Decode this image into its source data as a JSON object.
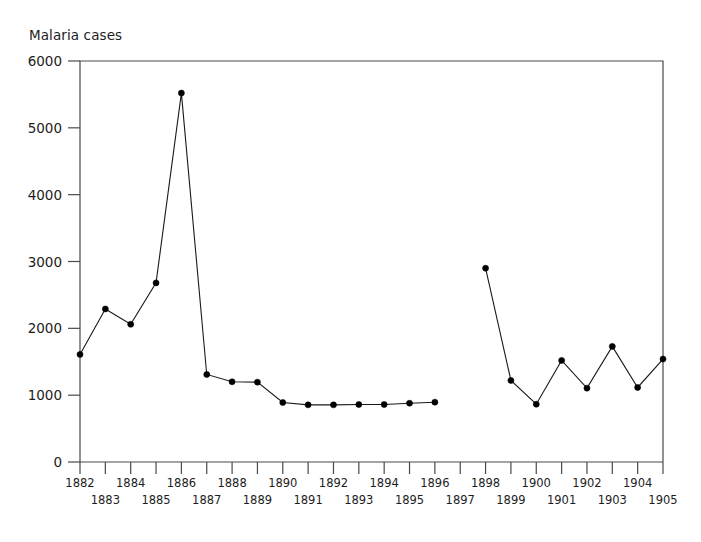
{
  "chart_data": {
    "type": "line",
    "title": "",
    "ylabel": "Malaria cases",
    "xlabel": "",
    "ylim": [
      0,
      6000
    ],
    "yticks": [
      0,
      1000,
      2000,
      3000,
      4000,
      5000,
      6000
    ],
    "ytick_labels": [
      "0",
      "1000",
      "2000",
      "3000",
      "4000",
      "5000",
      "6000"
    ],
    "xlim": [
      1882,
      1905
    ],
    "xticks": [
      1882,
      1883,
      1884,
      1885,
      1886,
      1887,
      1888,
      1889,
      1890,
      1891,
      1892,
      1893,
      1894,
      1895,
      1896,
      1897,
      1898,
      1899,
      1900,
      1901,
      1902,
      1903,
      1904,
      1905
    ],
    "xtick_labels": [
      "1882",
      "1883",
      "1884",
      "1885",
      "1886",
      "1887",
      "1888",
      "1889",
      "1890",
      "1891",
      "1892",
      "1893",
      "1894",
      "1895",
      "1896",
      "1897",
      "1898",
      "1899",
      "1900",
      "1901",
      "1902",
      "1903",
      "1904",
      "1905"
    ],
    "grid": false,
    "legend": null,
    "marker": "circle",
    "line_color": "#1a1a1a",
    "marker_color": "#000000",
    "x": [
      1882,
      1883,
      1884,
      1885,
      1886,
      1887,
      1888,
      1889,
      1890,
      1891,
      1892,
      1893,
      1894,
      1895,
      1896,
      1898,
      1899,
      1900,
      1901,
      1902,
      1903,
      1904,
      1905
    ],
    "values": [
      1610,
      2290,
      2060,
      2680,
      5520,
      1310,
      1200,
      1195,
      890,
      855,
      855,
      860,
      860,
      880,
      895,
      2900,
      1220,
      865,
      1520,
      1105,
      1730,
      1115,
      1540
    ],
    "series": [
      {
        "name": "Malaria cases",
        "points": [
          {
            "x": 1882,
            "y": 1610
          },
          {
            "x": 1883,
            "y": 2290
          },
          {
            "x": 1884,
            "y": 2060
          },
          {
            "x": 1885,
            "y": 2680
          },
          {
            "x": 1886,
            "y": 5520
          },
          {
            "x": 1887,
            "y": 1310
          },
          {
            "x": 1888,
            "y": 1200
          },
          {
            "x": 1889,
            "y": 1195
          },
          {
            "x": 1890,
            "y": 890
          },
          {
            "x": 1891,
            "y": 855
          },
          {
            "x": 1892,
            "y": 855
          },
          {
            "x": 1893,
            "y": 860
          },
          {
            "x": 1894,
            "y": 860
          },
          {
            "x": 1895,
            "y": 880
          },
          {
            "x": 1896,
            "y": 895
          },
          {
            "x": 1898,
            "y": 2900
          },
          {
            "x": 1899,
            "y": 1220
          },
          {
            "x": 1900,
            "y": 865
          },
          {
            "x": 1901,
            "y": 1520
          },
          {
            "x": 1902,
            "y": 1105
          },
          {
            "x": 1903,
            "y": 1730
          },
          {
            "x": 1904,
            "y": 1115
          },
          {
            "x": 1905,
            "y": 1540
          }
        ]
      }
    ],
    "missing_x": [
      1897
    ],
    "annotations": []
  },
  "layout": {
    "plot_left": 80,
    "plot_right": 663,
    "plot_top": 61,
    "plot_bottom": 462,
    "xtick_row_offsets": [
      14,
      31
    ]
  }
}
